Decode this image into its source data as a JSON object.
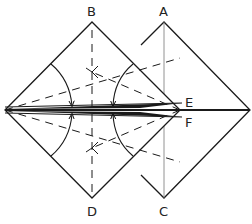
{
  "diagram": {
    "type": "origami-fold",
    "labels": {
      "A": "A",
      "B": "B",
      "C": "C",
      "D": "D",
      "E": "E",
      "F": "F"
    },
    "colors": {
      "line": "#1a1a1a",
      "thin_line": "#666666",
      "background": "#ffffff"
    }
  }
}
